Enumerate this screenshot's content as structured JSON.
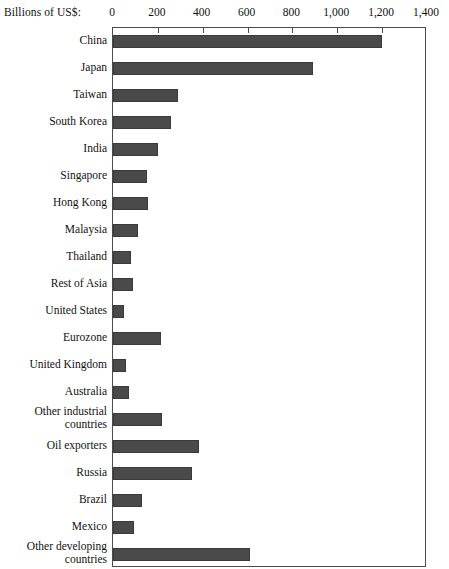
{
  "chart_data": {
    "type": "bar",
    "orientation": "horizontal",
    "title": "",
    "subtitle": "",
    "xlabel": "Billions of US$:",
    "ylabel": "",
    "xlim": [
      0,
      1400
    ],
    "ylim": null,
    "grid": false,
    "legend": null,
    "axis_caption": "Billions of US$:",
    "tick_labels": [
      "0",
      "200",
      "400",
      "600",
      "800",
      "1,000",
      "1,200",
      "1,400"
    ],
    "tick_values": [
      0,
      200,
      400,
      600,
      800,
      1000,
      1200,
      1400
    ],
    "bar_color": "#4a4a4a",
    "bar_border_color": "#3a3a3a",
    "frame_color": "#4c4c4c",
    "categories": [
      "China",
      "Japan",
      "Taiwan",
      "South Korea",
      "India",
      "Singapore",
      "Hong Kong",
      "Malaysia",
      "Thailand",
      "Rest of Asia",
      "United States",
      "Eurozone",
      "United Kingdom",
      "Australia",
      "Other industrial\ncountries",
      "Oil exporters",
      "Russia",
      "Brazil",
      "Mexico",
      "Other developing\ncountries"
    ],
    "values": [
      1200,
      890,
      290,
      260,
      200,
      150,
      155,
      110,
      80,
      90,
      50,
      215,
      60,
      70,
      220,
      385,
      350,
      130,
      95,
      610
    ]
  }
}
